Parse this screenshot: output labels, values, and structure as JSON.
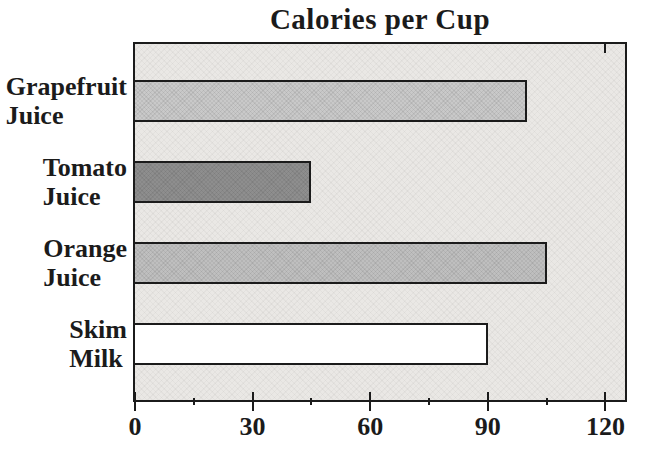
{
  "chart_data": {
    "type": "bar",
    "orientation": "horizontal",
    "title": "Calories per Cup",
    "categories": [
      [
        "Grapefruit",
        "Juice"
      ],
      [
        "Tomato",
        "Juice"
      ],
      [
        "Orange",
        "Juice"
      ],
      [
        "Skim",
        "Milk"
      ]
    ],
    "values": [
      100,
      45,
      105,
      90
    ],
    "units": "calories",
    "xlabel": "",
    "ylabel": "",
    "xlim": [
      0,
      125
    ],
    "x_ticks": [
      0,
      30,
      60,
      90,
      120
    ],
    "x_tick_labels": [
      "0",
      "30",
      "60",
      "90",
      "120"
    ],
    "x_minor_ticks": [
      15,
      45,
      75,
      105
    ],
    "grid": false,
    "legend": false,
    "bar_fills": [
      "#c9c9c9",
      "#8e8e8e",
      "#bfbfbf",
      "#ffffff"
    ],
    "plot_background": "#eae8e5",
    "ink_color": "#1b1b1b"
  }
}
